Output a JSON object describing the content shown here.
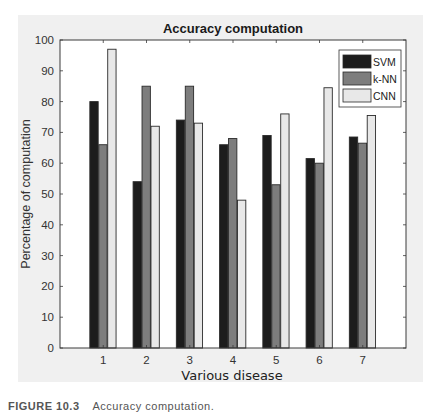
{
  "chart_data": {
    "type": "bar",
    "title": "Accuracy computation",
    "xlabel": "Various disease",
    "ylabel": "Percentage of computation",
    "categories": [
      "1",
      "2",
      "3",
      "4",
      "5",
      "6",
      "7"
    ],
    "series": [
      {
        "name": "SVM",
        "color": "#1c1c1c",
        "values": [
          80,
          54,
          74,
          66,
          69,
          61.5,
          68.5
        ]
      },
      {
        "name": "k-NN",
        "color": "#7d7d7d",
        "values": [
          66,
          85,
          85,
          68,
          53,
          60,
          66.5
        ]
      },
      {
        "name": "CNN",
        "color": "#e8e8e8",
        "values": [
          97,
          72,
          73,
          48,
          76,
          84.5,
          75.5
        ]
      }
    ],
    "ylim": [
      0,
      100
    ],
    "xlim": [
      0,
      8
    ],
    "yticks": [
      0,
      10,
      20,
      30,
      40,
      50,
      60,
      70,
      80,
      90,
      100
    ],
    "grid": false,
    "legend_position": "top-right"
  },
  "caption": {
    "figure_number": "FIGURE 10.3",
    "text": "Accuracy computation."
  }
}
